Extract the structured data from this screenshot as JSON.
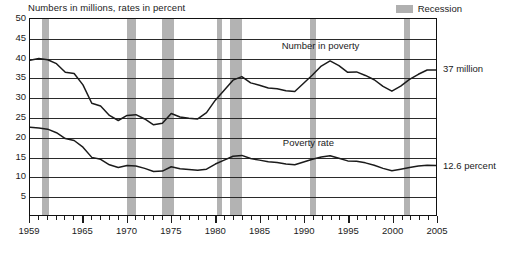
{
  "chart_data": {
    "type": "line",
    "title": "Numbers in millions, rates in percent",
    "xlabel": "",
    "ylabel": "",
    "xlim": [
      1959,
      2005
    ],
    "ylim": [
      0,
      50
    ],
    "yticks": [
      5,
      10,
      15,
      20,
      25,
      30,
      35,
      40,
      45,
      50
    ],
    "xticks": [
      1959,
      1965,
      1970,
      1975,
      1980,
      1985,
      1990,
      1995,
      2000,
      2005
    ],
    "xtick_labels": [
      "1959",
      "1965",
      "1970",
      "1975",
      "1980",
      "1985",
      "1990",
      "1995",
      "2000",
      "2005"
    ],
    "grid": true,
    "legend_position": "top-right",
    "legend": [
      {
        "label": "Recession",
        "color": "#b0b0b0",
        "type": "band"
      }
    ],
    "annotations": [
      {
        "text": "Number in poverty",
        "x": 1992,
        "y": 43
      },
      {
        "text": "Poverty rate",
        "x": 1991,
        "y": 18.5
      },
      {
        "text": "37 million",
        "x": 2006,
        "y": 37
      },
      {
        "text": "12.6 percent",
        "x": 2006,
        "y": 12.6
      }
    ],
    "recessions": [
      {
        "start": 1960.3,
        "end": 1961.2
      },
      {
        "start": 1969.9,
        "end": 1970.9
      },
      {
        "start": 1973.9,
        "end": 1975.2
      },
      {
        "start": 1980.1,
        "end": 1980.6
      },
      {
        "start": 1981.5,
        "end": 1982.9
      },
      {
        "start": 1990.6,
        "end": 1991.2
      },
      {
        "start": 2001.2,
        "end": 2001.9
      }
    ],
    "x": [
      1959,
      1960,
      1961,
      1962,
      1963,
      1964,
      1965,
      1966,
      1967,
      1968,
      1969,
      1970,
      1971,
      1972,
      1973,
      1974,
      1975,
      1976,
      1977,
      1978,
      1979,
      1980,
      1981,
      1982,
      1983,
      1984,
      1985,
      1986,
      1987,
      1988,
      1989,
      1990,
      1991,
      1992,
      1993,
      1994,
      1995,
      1996,
      1997,
      1998,
      1999,
      2000,
      2001,
      2002,
      2003,
      2004,
      2005
    ],
    "series": [
      {
        "name": "Number in poverty",
        "units": "millions",
        "color": "#1b1b1b",
        "last_value": 37.0,
        "last_label": "37 million",
        "values": [
          39.5,
          39.9,
          39.6,
          38.6,
          36.4,
          36.1,
          33.2,
          28.5,
          27.8,
          25.4,
          24.1,
          25.4,
          25.6,
          24.5,
          23.0,
          23.4,
          25.9,
          25.0,
          24.7,
          24.5,
          26.1,
          29.3,
          31.8,
          34.4,
          35.3,
          33.7,
          33.1,
          32.4,
          32.2,
          31.7,
          31.5,
          33.6,
          35.7,
          38.0,
          39.3,
          38.1,
          36.4,
          36.5,
          35.6,
          34.5,
          32.8,
          31.6,
          32.9,
          34.6,
          35.9,
          37.0,
          37.0
        ]
      },
      {
        "name": "Poverty rate",
        "units": "percent",
        "color": "#1b1b1b",
        "last_value": 12.6,
        "last_label": "12.6 percent",
        "values": [
          22.4,
          22.2,
          21.9,
          21.0,
          19.5,
          19.0,
          17.3,
          14.7,
          14.2,
          12.8,
          12.1,
          12.6,
          12.5,
          11.9,
          11.1,
          11.2,
          12.3,
          11.8,
          11.6,
          11.4,
          11.7,
          13.0,
          14.0,
          15.0,
          15.2,
          14.4,
          14.0,
          13.6,
          13.4,
          13.0,
          12.8,
          13.5,
          14.2,
          14.8,
          15.1,
          14.5,
          13.8,
          13.7,
          13.3,
          12.7,
          11.9,
          11.3,
          11.7,
          12.1,
          12.5,
          12.7,
          12.6
        ]
      }
    ]
  },
  "chart": {
    "title": "Numbers in millions, rates in percent",
    "legend_label": "Recession",
    "annotation_number": "Number in poverty",
    "annotation_rate": "Poverty rate",
    "right_label_number": "37 million",
    "right_label_rate": "12.6 percent",
    "ytick_labels": [
      "50",
      "45",
      "40",
      "35",
      "30",
      "25",
      "20",
      "15",
      "10",
      "5"
    ]
  }
}
